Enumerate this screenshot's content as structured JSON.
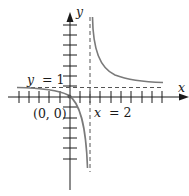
{
  "figure": {
    "type": "function-graph",
    "axes": {
      "x_label": "x",
      "y_label": "y"
    },
    "annotations": {
      "horizontal_asymptote": "y = 1",
      "vertical_asymptote": "x = 2",
      "point": "(0, 0)"
    },
    "labels": {
      "y_eq": "y",
      "y_eq_rest": "= 1",
      "x_eq": "x",
      "x_eq_rest": "= 2",
      "origin": "(0, 0)"
    },
    "colors": {
      "axis": "#1a1a1a",
      "curve": "#7a7a7a",
      "asymptote": "#555555"
    }
  }
}
